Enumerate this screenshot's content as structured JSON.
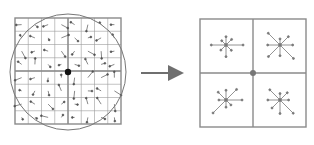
{
  "figure": {
    "left_panel": {
      "label": "image-gradients",
      "grid": {
        "rows": 8,
        "cols": 8,
        "quadrants": 2
      },
      "weighting_circle": true,
      "keypoint_marker": true
    },
    "arrow": {
      "direction": "right"
    },
    "right_panel": {
      "label": "keypoint-descriptor",
      "grid": {
        "rows": 2,
        "cols": 2
      },
      "histogram_bins": 8,
      "keypoint_marker": true
    },
    "caption": "",
    "colors": {
      "line": "#8a8a8a",
      "arrow": "#6f6f6f",
      "dot": "#111111",
      "bg": "#ffffff"
    }
  }
}
